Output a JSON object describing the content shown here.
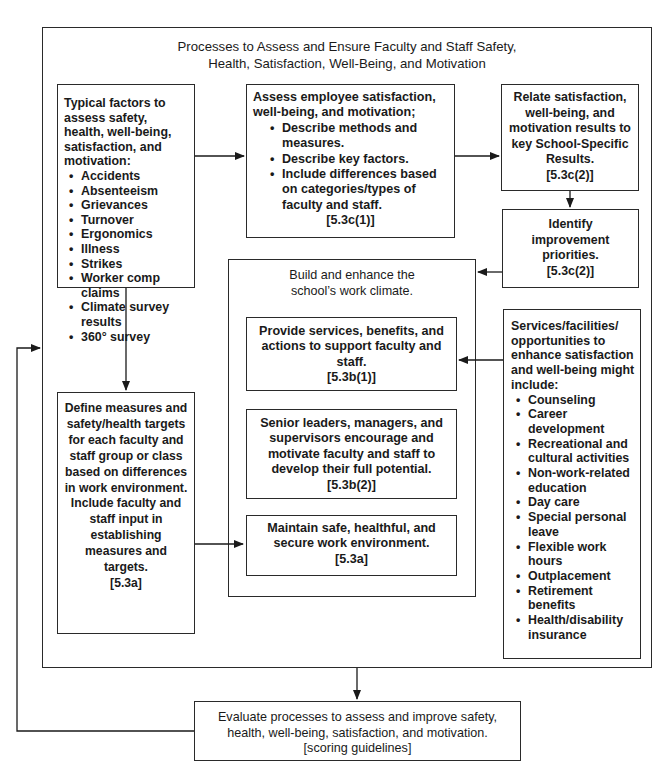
{
  "cut_off_title": "Figure 5.3 Faculty and Staff Well-Being and Satisfaction",
  "outer": {
    "title_lines": [
      "Processes to Assess and Ensure Faculty and Staff Safety,",
      "Health, Satisfaction, Well-Being, and Motivation"
    ]
  },
  "factors_box": {
    "heading": "Typical factors to assess safety, health, well-being, satisfaction, and motivation:",
    "items": [
      "Accidents",
      "Absenteeism",
      "Grievances",
      "Turnover",
      "Ergonomics",
      "Illness",
      "Strikes",
      "Worker comp claims",
      "Climate survey results",
      "360° survey"
    ]
  },
  "define_box": {
    "text": "Define measures and safety/health targets for each faculty and staff group or class based on differences in work environment. Include faculty and staff input in establishing measures and targets.",
    "ref": "[5.3a]"
  },
  "assess_box": {
    "heading": "Assess employee satisfaction, well-being, and motivation;",
    "items": [
      "Describe methods and measures.",
      "Describe key factors.",
      "Include differences based on categories/types of faculty and staff."
    ],
    "ref": "[5.3c(1)]"
  },
  "relate_box": {
    "text": "Relate satisfaction, well-being, and motivation results to key School-Specific Results.",
    "ref": "[5.3c(2)]"
  },
  "identify_box": {
    "text": "Identify improvement priorities.",
    "ref": "[5.3c(2)]"
  },
  "climate_box": {
    "title": "Build and enhance the school’s work climate.",
    "provide": {
      "text": "Provide services, benefits, and actions to support faculty and staff.",
      "ref": "[5.3b(1)]"
    },
    "leaders": {
      "text": "Senior leaders, managers, and supervisors encourage and motivate faculty and staff to develop their full potential.",
      "ref": "[5.3b(2)]"
    },
    "maintain": {
      "text": "Maintain safe, healthful, and secure work environment.",
      "ref": "[5.3a]"
    }
  },
  "services_box": {
    "heading": "Services/facilities/ opportunities to enhance satisfaction and well-being might include:",
    "items": [
      "Counseling",
      "Career development",
      "Recreational and cultural activities",
      "Non-work-related education",
      "Day care",
      "Special personal leave",
      "Flexible work hours",
      "Outplacement",
      "Retirement benefits",
      "Health/disability insurance"
    ]
  },
  "evaluate_box": {
    "text": "Evaluate processes to assess and improve safety, health, well-being, satisfaction, and motivation.",
    "ref": "[scoring guidelines]"
  }
}
